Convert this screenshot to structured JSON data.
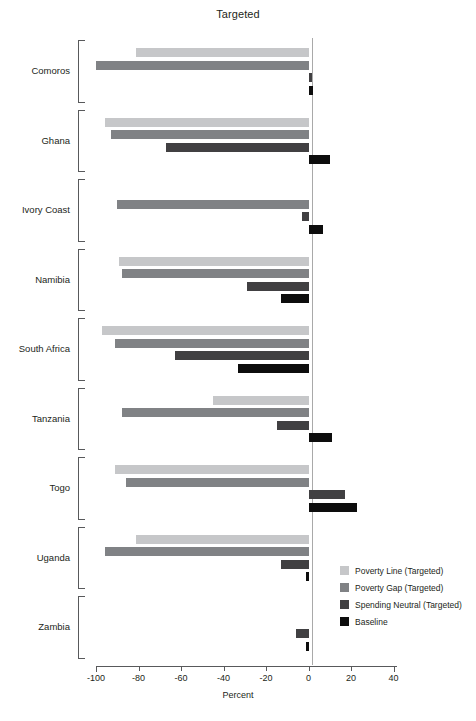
{
  "chart_data": {
    "type": "bar",
    "orientation": "horizontal",
    "title": "Targeted",
    "xlabel": "Percent",
    "ylabel": "",
    "xlim": [
      -105,
      45
    ],
    "xticks": [
      -100,
      -80,
      -60,
      -40,
      -20,
      0,
      20,
      40
    ],
    "xtick_labels": [
      "-100",
      "-80",
      "-60",
      "-40",
      "-20",
      "0",
      "20",
      "40"
    ],
    "grid": false,
    "legend_position": "lower-right",
    "categories": [
      "Comoros",
      "Ghana",
      "Ivory Coast",
      "Namibia",
      "South Africa",
      "Tanzania",
      "Togo",
      "Uganda",
      "Zambia"
    ],
    "series": [
      {
        "name": "Poverty Line (Targeted)",
        "color": "#c6c7c9",
        "values": [
          -81,
          -96,
          0,
          -89,
          -97,
          -45,
          -91,
          -81,
          0
        ]
      },
      {
        "name": "Poverty Gap (Targeted)",
        "color": "#808285",
        "values": [
          -100,
          -93,
          -90,
          -88,
          -91,
          -88,
          -86,
          -96,
          0
        ]
      },
      {
        "name": "Spending Neutral (Targeted)",
        "color": "#414042",
        "values": [
          1,
          -67,
          -3,
          -29,
          -63,
          -15,
          17,
          -13,
          -6
        ]
      },
      {
        "name": "Baseline",
        "color": "#0d0d0d",
        "values": [
          2,
          10,
          7,
          -13,
          -33,
          11,
          23,
          -1,
          -1
        ]
      }
    ]
  },
  "legend": {
    "items": [
      {
        "label": "Poverty Line (Targeted)",
        "color": "#c6c7c9"
      },
      {
        "label": "Poverty Gap (Targeted)",
        "color": "#808285"
      },
      {
        "label": "Spending Neutral (Targeted)",
        "color": "#414042"
      },
      {
        "label": "Baseline",
        "color": "#0d0d0d"
      }
    ]
  },
  "colors": {
    "axis": "#58595b",
    "zero_line": "#a9a9a9",
    "text": "#231f20",
    "background": "#ffffff"
  }
}
